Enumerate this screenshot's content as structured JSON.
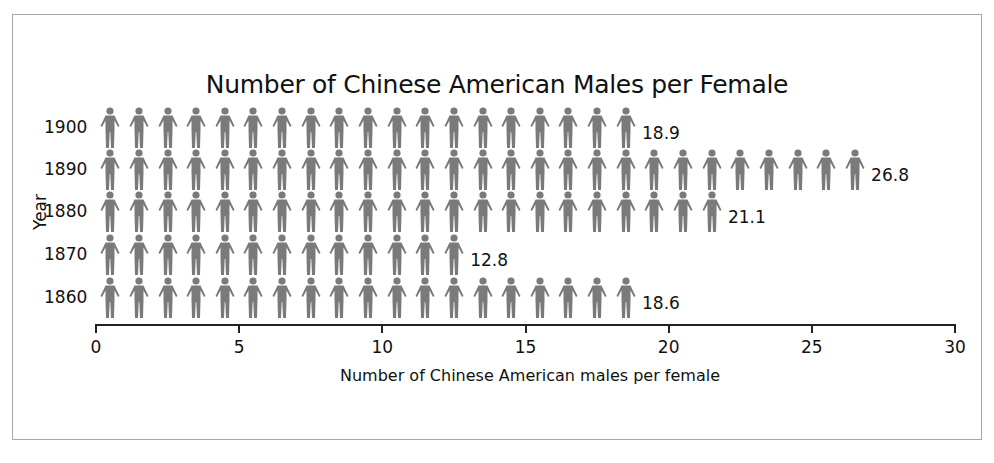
{
  "chart_data": {
    "type": "bar",
    "subtype": "pictograph",
    "title": "Number of Chinese American Males per Female",
    "xlabel": "Number of Chinese American males per female",
    "ylabel": "Year",
    "categories": [
      "1900",
      "1890",
      "1880",
      "1870",
      "1860"
    ],
    "values": [
      18.9,
      26.8,
      21.1,
      12.8,
      18.6
    ],
    "value_labels": [
      "18.9",
      "26.8",
      "21.1",
      "12.8",
      "18.6"
    ],
    "xlim": [
      0,
      30
    ],
    "xticks": [
      "0",
      "5",
      "10",
      "15",
      "20",
      "25",
      "30"
    ],
    "grid": false,
    "legend": null,
    "icon": "person-icon",
    "icon_unit": 1,
    "icon_color": "#7a7a7a"
  },
  "labels": {
    "title": "Number of Chinese American Males per Female",
    "xlabel": "Number of Chinese American males per female",
    "ylabel": "Year"
  }
}
